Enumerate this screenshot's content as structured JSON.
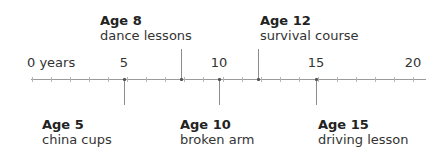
{
  "timeline": {
    "axis": {
      "min": 0,
      "max": 20,
      "unit": "years",
      "tick_labels": [
        {
          "value": 0,
          "label": "0 years"
        },
        {
          "value": 5,
          "label": "5"
        },
        {
          "value": 10,
          "label": "10"
        },
        {
          "value": 15,
          "label": "15"
        },
        {
          "value": 20,
          "label": "20"
        }
      ]
    },
    "events_above": [
      {
        "age": 8,
        "title": "Age 8",
        "description": "dance lessons"
      },
      {
        "age": 12,
        "title": "Age 12",
        "description": "survival course"
      }
    ],
    "events_below": [
      {
        "age": 5,
        "title": "Age 5",
        "description": "china cups"
      },
      {
        "age": 10,
        "title": "Age 10",
        "description": "broken arm"
      },
      {
        "age": 15,
        "title": "Age 15",
        "description": "driving lesson"
      }
    ]
  }
}
